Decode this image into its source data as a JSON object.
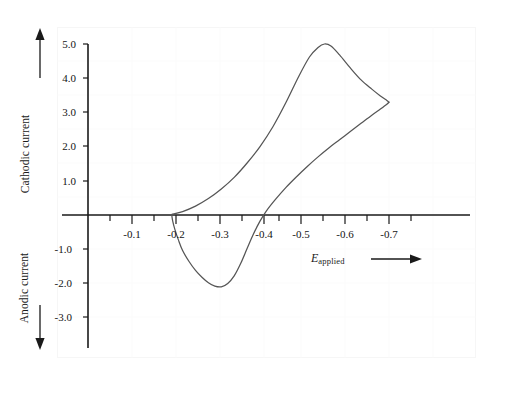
{
  "figure": {
    "background_color": "#ffffff",
    "frame_color": "#fafafa",
    "grid_color": "#fbfbfb",
    "axis_color": "#1a1a1a",
    "curve_color": "#555555"
  },
  "labels": {
    "y_axis_upper": "Cathodic current",
    "y_axis_lower": "Anodic current",
    "x_axis_symbol": "E",
    "x_axis_subscript": "applied",
    "y_up_arrow": "up-arrow",
    "y_down_arrow": "down-arrow",
    "x_arrow": "right-arrow"
  },
  "chart_data": {
    "type": "line",
    "title": "",
    "subtitle": "",
    "xlabel": "E_applied",
    "ylabel": "Current (cathodic positive, anodic negative)",
    "xlim": [
      0.0,
      -0.78
    ],
    "ylim": [
      -3.6,
      5.4
    ],
    "grid": true,
    "legend": "none",
    "x_ticks_major": [
      "-0.1",
      "-0.2",
      "-0.3",
      "-0.4",
      "-0.5",
      "-0.6",
      "-0.7"
    ],
    "x_tick_values_major": [
      -0.1,
      -0.2,
      -0.3,
      -0.4,
      -0.5,
      -0.6,
      -0.7
    ],
    "x_tick_values_minor": [
      -0.05,
      -0.15,
      -0.25,
      -0.35,
      -0.45,
      -0.55,
      -0.65,
      -0.75
    ],
    "y_ticks": [
      "5.0",
      "4.0",
      "3.0",
      "2.0",
      "1.0",
      "-1.0",
      "-2.0",
      "-3.0"
    ],
    "y_tick_values": [
      5.0,
      4.0,
      3.0,
      2.0,
      1.0,
      -1.0,
      -2.0,
      -3.0
    ],
    "annotations": [
      {
        "name": "cathodic-peak",
        "x": -0.55,
        "y": 5.0
      },
      {
        "name": "switching-potential",
        "x": -0.7,
        "y": 3.3
      },
      {
        "name": "anodic-peak",
        "x": -0.39,
        "y": -2.1
      },
      {
        "name": "sweep-start",
        "x": -0.195,
        "y": 0.0
      }
    ],
    "series": [
      {
        "name": "forward-sweep-cathodic",
        "direction": "negative-going",
        "points": [
          [
            -0.195,
            0.02
          ],
          [
            -0.22,
            0.1
          ],
          [
            -0.25,
            0.26
          ],
          [
            -0.28,
            0.48
          ],
          [
            -0.31,
            0.76
          ],
          [
            -0.34,
            1.1
          ],
          [
            -0.37,
            1.52
          ],
          [
            -0.4,
            2.0
          ],
          [
            -0.43,
            2.58
          ],
          [
            -0.46,
            3.28
          ],
          [
            -0.49,
            4.05
          ],
          [
            -0.515,
            4.62
          ],
          [
            -0.535,
            4.9
          ],
          [
            -0.55,
            5.0
          ],
          [
            -0.565,
            4.94
          ],
          [
            -0.585,
            4.68
          ],
          [
            -0.61,
            4.3
          ],
          [
            -0.635,
            3.95
          ],
          [
            -0.66,
            3.68
          ],
          [
            -0.68,
            3.48
          ],
          [
            -0.695,
            3.35
          ],
          [
            -0.7,
            3.3
          ]
        ]
      },
      {
        "name": "reverse-sweep-anodic",
        "direction": "positive-going",
        "points": [
          [
            -0.7,
            3.3
          ],
          [
            -0.695,
            3.24
          ],
          [
            -0.68,
            3.1
          ],
          [
            -0.66,
            2.92
          ],
          [
            -0.635,
            2.68
          ],
          [
            -0.61,
            2.44
          ],
          [
            -0.585,
            2.2
          ],
          [
            -0.56,
            1.96
          ],
          [
            -0.535,
            1.7
          ],
          [
            -0.51,
            1.42
          ],
          [
            -0.485,
            1.12
          ],
          [
            -0.46,
            0.8
          ],
          [
            -0.435,
            0.44
          ],
          [
            -0.415,
            0.12
          ],
          [
            -0.4,
            -0.18
          ],
          [
            -0.385,
            -0.55
          ],
          [
            -0.37,
            -0.98
          ],
          [
            -0.355,
            -1.42
          ],
          [
            -0.34,
            -1.78
          ],
          [
            -0.325,
            -2.0
          ],
          [
            -0.31,
            -2.1
          ],
          [
            -0.295,
            -2.08
          ],
          [
            -0.28,
            -1.98
          ],
          [
            -0.265,
            -1.82
          ],
          [
            -0.25,
            -1.62
          ],
          [
            -0.235,
            -1.36
          ],
          [
            -0.22,
            -1.04
          ],
          [
            -0.21,
            -0.72
          ],
          [
            -0.202,
            -0.42
          ],
          [
            -0.197,
            -0.18
          ],
          [
            -0.195,
            -0.02
          ]
        ]
      }
    ]
  }
}
